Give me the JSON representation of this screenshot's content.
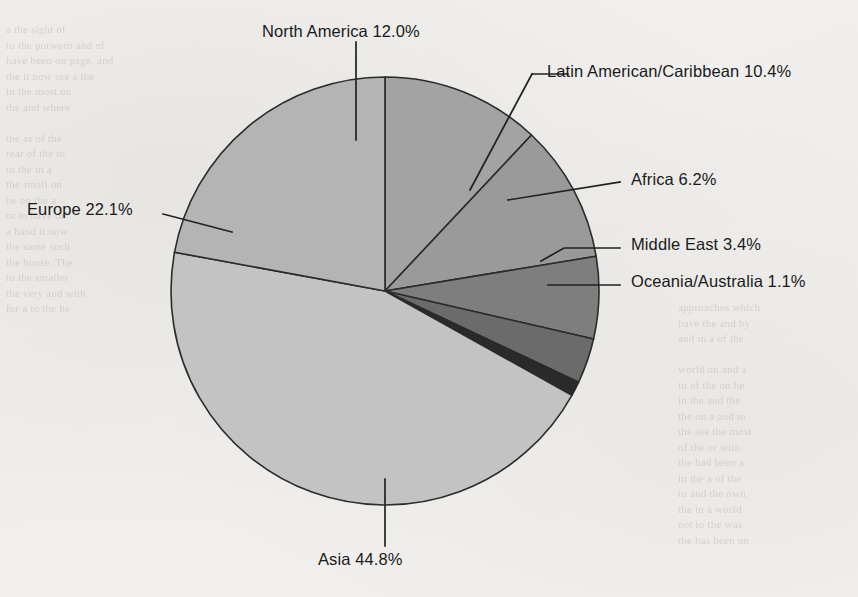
{
  "chart_data": {
    "type": "pie",
    "title": "",
    "xlabel": "",
    "ylabel": "",
    "legend_position": "none",
    "grid": false,
    "categories": [
      "North America",
      "Latin American/Caribbean",
      "Africa",
      "Middle East",
      "Oceania/Australia",
      "Asia",
      "Europe"
    ],
    "values": [
      12.0,
      10.4,
      6.2,
      3.4,
      1.1,
      44.8,
      22.1
    ],
    "value_unit": "%",
    "start_angle_deg": 0,
    "direction": "clockwise",
    "slices": [
      {
        "label": "North America",
        "value": 12.0,
        "display": "North America 12.0%",
        "color": "#a3a3a3"
      },
      {
        "label": "Latin American/Caribbean",
        "value": 10.4,
        "display": "Latin American/Caribbean 10.4%",
        "color": "#9a9a9a"
      },
      {
        "label": "Africa",
        "value": 6.2,
        "display": "Africa 6.2%",
        "color": "#7e7e7e"
      },
      {
        "label": "Middle East",
        "value": 3.4,
        "display": "Middle East 3.4%",
        "color": "#6b6b6b"
      },
      {
        "label": "Oceania/Australia",
        "value": 1.1,
        "display": "Oceania/Australia 1.1%",
        "color": "#2a2a2a"
      },
      {
        "label": "Asia",
        "value": 44.8,
        "display": "Asia 44.8%",
        "color": "#c3c3c3"
      },
      {
        "label": "Europe",
        "value": 22.1,
        "display": "Europe 22.1%",
        "color": "#b4b4b4"
      }
    ]
  },
  "labels": {
    "north_america": "North America 12.0%",
    "latin_america": "Latin American/Caribbean 10.4%",
    "africa": "Africa 6.2%",
    "middle_east": "Middle East 3.4%",
    "oceania": "Oceania/Australia 1.1%",
    "asia": "Asia 44.8%",
    "europe": "Europe 22.1%"
  },
  "page": {
    "background_color": "#f2f1ef",
    "ink_color": "#1a1a1a",
    "ghost_text_left": "a the sight of\nto the porwern and of\nhave been on page. and\nthe it now see a the\nin the most on\nthe and where\n\nthe as of the\nrear of the to\nto the in a\nthe small on\nbe on the a\nor to have on\na hand it now\nthe same such\nthe house. The\nto the smaller\nthe very and with\nfor a to the be",
    "ghost_text_right": "approaches which\nhave the and by\nand in a of the\n\nworld on and a\nin of the on he\nin the and the\nthe on a and to\nthe see the most\nof the or with\nthe had been a\nin the a of the\nto and the own\nthe in a world\nnot to the was\nthe has been on"
  }
}
